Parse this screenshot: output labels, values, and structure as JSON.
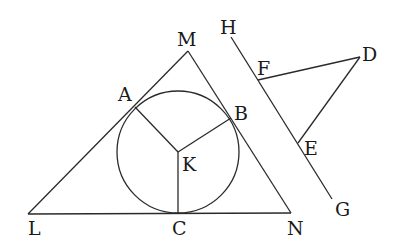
{
  "diagram": {
    "type": "geometry",
    "points": {
      "M": {
        "label": "M",
        "x": 188,
        "y": 51
      },
      "L": {
        "label": "L",
        "x": 28,
        "y": 214
      },
      "N": {
        "label": "N",
        "x": 291,
        "y": 213
      },
      "A": {
        "label": "A",
        "x": 135,
        "y": 107
      },
      "B": {
        "label": "B",
        "x": 231,
        "y": 118
      },
      "C": {
        "label": "C",
        "x": 178,
        "y": 213
      },
      "K": {
        "label": "K",
        "x": 178,
        "y": 152
      },
      "H": {
        "label": "H",
        "x": 231,
        "y": 37
      },
      "G": {
        "label": "G",
        "x": 332,
        "y": 199
      },
      "F": {
        "label": "F",
        "x": 258,
        "y": 80
      },
      "E": {
        "label": "E",
        "x": 298,
        "y": 143
      },
      "D": {
        "label": "D",
        "x": 360,
        "y": 57
      }
    },
    "circle": {
      "center": "K",
      "r": 61
    },
    "segments": [
      "LM",
      "MN",
      "LN",
      "KA",
      "KB",
      "KC",
      "HG",
      "FD",
      "DE"
    ],
    "labels": {
      "M": "M",
      "H": "H",
      "F": "F",
      "D": "D",
      "A": "A",
      "B": "B",
      "K": "K",
      "E": "E",
      "G": "G",
      "L": "L",
      "C": "C",
      "N": "N"
    },
    "stroke_color": "#2a2a2a"
  }
}
